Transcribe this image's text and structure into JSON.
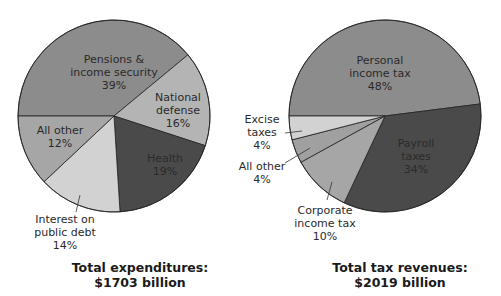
{
  "chart_data": [
    {
      "type": "pie",
      "title": "Total expenditures:",
      "subtitle": "$1703 billion",
      "categories": [
        "Pensions & income security",
        "National defense",
        "Health",
        "Interest on public debt",
        "All other"
      ],
      "values": [
        39,
        16,
        19,
        14,
        12
      ],
      "unit": "%",
      "colors": [
        "#8c8c8c",
        "#b4b4b4",
        "#4a4a4a",
        "#d2d2d2",
        "#a6a6a6"
      ]
    },
    {
      "type": "pie",
      "title": "Total tax revenues:",
      "subtitle": "$2019 billion",
      "categories": [
        "Personal income tax",
        "Payroll taxes",
        "Corporate income tax",
        "All other",
        "Excise taxes"
      ],
      "values": [
        48,
        34,
        10,
        4,
        4
      ],
      "unit": "%",
      "colors": [
        "#8c8c8c",
        "#4a4a4a",
        "#a6a6a6",
        "#a0a0a0",
        "#d2d2d2"
      ]
    }
  ],
  "labels": {
    "left": {
      "pensions": "Pensions &\nincome security\n39%",
      "defense": "National\ndefense\n16%",
      "health": "Health\n19%",
      "interest": "Interest on\npublic debt\n14%",
      "other": "All other\n12%"
    },
    "right": {
      "personal": "Personal\nincome tax\n48%",
      "payroll": "Payroll\ntaxes\n34%",
      "corporate": "Corporate\nincome tax\n10%",
      "other": "All other\n4%",
      "excise": "Excise\ntaxes\n4%"
    }
  },
  "titles": {
    "left_line1": "Total expenditures:",
    "left_line2": "$1703 billion",
    "right_line1": "Total tax revenues:",
    "right_line2": "$2019 billion"
  }
}
